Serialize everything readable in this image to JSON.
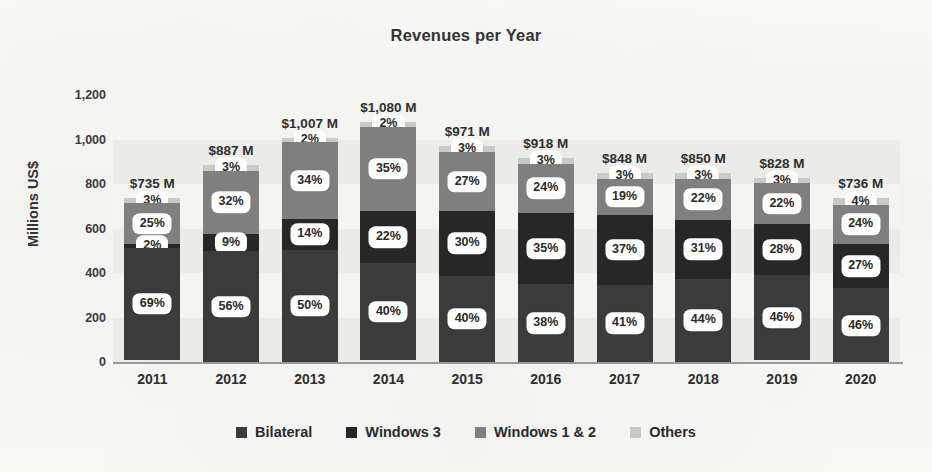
{
  "chart_data": {
    "type": "bar",
    "subtype": "stacked-bar",
    "title": "Revenues per Year",
    "xlabel": "",
    "ylabel": "Millions US$",
    "ylim": [
      0,
      1200
    ],
    "yticks": [
      0,
      200,
      400,
      600,
      800,
      1000,
      1200
    ],
    "ytick_labels": [
      "0",
      "200",
      "400",
      "600",
      "800",
      "1,000",
      "1,200"
    ],
    "grid": false,
    "background_bands": true,
    "legend_position": "bottom",
    "categories": [
      "2011",
      "2012",
      "2013",
      "2014",
      "2015",
      "2016",
      "2017",
      "2018",
      "2019",
      "2020"
    ],
    "totals": [
      735,
      887,
      1007,
      1080,
      971,
      918,
      848,
      850,
      828,
      736
    ],
    "total_labels": [
      "$735 M",
      "$887 M",
      "$1,007 M",
      "$1,080 M",
      "$971 M",
      "$918 M",
      "$848 M",
      "$850 M",
      "$828 M",
      "$736 M"
    ],
    "series": [
      {
        "name": "Bilateral",
        "color": "#3b3b3b",
        "values": [
          69,
          56,
          50,
          40,
          40,
          38,
          41,
          44,
          46,
          46
        ],
        "value_labels": [
          "69%",
          "56%",
          "50%",
          "40%",
          "40%",
          "38%",
          "41%",
          "44%",
          "46%",
          "46%"
        ]
      },
      {
        "name": "Windows 3",
        "color": "#272727",
        "values": [
          2,
          9,
          14,
          22,
          30,
          35,
          37,
          31,
          28,
          27
        ],
        "value_labels": [
          "2%",
          "9%",
          "14%",
          "22%",
          "30%",
          "35%",
          "37%",
          "31%",
          "28%",
          "27%"
        ]
      },
      {
        "name": "Windows 1 & 2",
        "color": "#7f7f7f",
        "values": [
          25,
          32,
          34,
          35,
          27,
          24,
          19,
          22,
          22,
          24
        ],
        "value_labels": [
          "25%",
          "32%",
          "34%",
          "35%",
          "27%",
          "24%",
          "19%",
          "22%",
          "22%",
          "24%"
        ]
      },
      {
        "name": "Others",
        "color": "#c9c9c6",
        "values": [
          3,
          3,
          2,
          2,
          3,
          3,
          3,
          3,
          3,
          4
        ],
        "value_labels": [
          "3%",
          "3%",
          "2%",
          "2%",
          "3%",
          "3%",
          "3%",
          "3%",
          "3%",
          "4%"
        ]
      }
    ]
  },
  "legend": {
    "items": [
      {
        "label": "Bilateral",
        "color": "#3b3b3b"
      },
      {
        "label": "Windows 3",
        "color": "#272727"
      },
      {
        "label": "Windows 1 & 2",
        "color": "#7f7f7f"
      },
      {
        "label": "Others",
        "color": "#c9c9c6"
      }
    ]
  }
}
